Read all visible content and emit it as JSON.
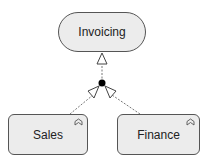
{
  "diagram": {
    "type": "ArchiMate generalization/aggregation",
    "nodes": {
      "parent": {
        "label": "Invoicing",
        "shape": "rounded-pill"
      },
      "child_left": {
        "label": "Sales",
        "shape": "rounded-box",
        "icon": "function-icon"
      },
      "child_right": {
        "label": "Finance",
        "shape": "rounded-box",
        "icon": "function-icon"
      }
    },
    "colors": {
      "node_fill": "#ececec",
      "stroke": "#555555",
      "junction": "#000000"
    }
  }
}
